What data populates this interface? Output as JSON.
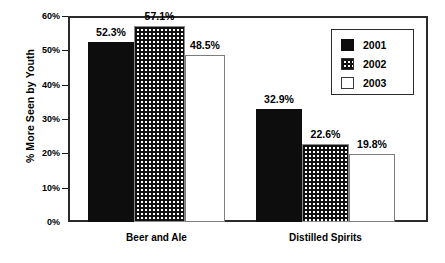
{
  "chart_data": {
    "type": "bar",
    "title": "",
    "subtitle": "",
    "xlabel": "",
    "ylabel": "% More Seen by Youth",
    "ylim": [
      0,
      60
    ],
    "ytick_labels": [
      "0%",
      "10%",
      "20%",
      "30%",
      "40%",
      "50%",
      "60%"
    ],
    "ytick_values": [
      0,
      10,
      20,
      30,
      40,
      50,
      60
    ],
    "grid": false,
    "legend_position": "upper-right",
    "categories": [
      "Beer and Ale",
      "Distilled Spirits"
    ],
    "series": [
      {
        "name": "2001",
        "fill": "solid-black",
        "values": [
          52.3,
          32.9
        ],
        "labels": [
          "52.3%",
          "32.9%"
        ]
      },
      {
        "name": "2002",
        "fill": "checkered-grid",
        "values": [
          57.1,
          22.6
        ],
        "labels": [
          "57.1%",
          "22.6%"
        ]
      },
      {
        "name": "2003",
        "fill": "white-outline",
        "values": [
          48.5,
          19.8
        ],
        "labels": [
          "48.5%",
          "19.8%"
        ]
      }
    ]
  },
  "legend": {
    "entries": [
      {
        "label": "2001",
        "swatch": "solid-black-swatch"
      },
      {
        "label": "2002",
        "swatch": "checkered-grid-swatch"
      },
      {
        "label": "2003",
        "swatch": "white-outline-swatch"
      }
    ]
  },
  "colors": {
    "series_2001": "#0d0d0d",
    "series_2002_pattern": "#111111",
    "series_2003": "#ffffff",
    "axis": "#2b2b2b",
    "background": "#ffffff",
    "text": "#000000"
  }
}
